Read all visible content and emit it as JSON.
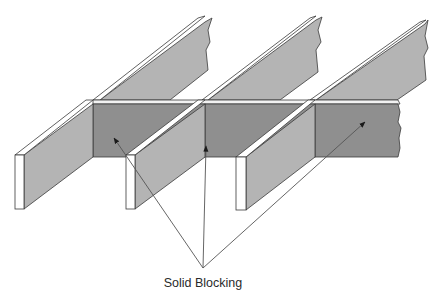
{
  "diagram": {
    "label": "Solid Blocking",
    "colors": {
      "joist_side": "#b4b4b4",
      "joist_top": "#ffffff",
      "blocking_face": "#8f8f8f",
      "blocking_top": "#f2f2f2",
      "outline": "#3a3a3a",
      "leader": "#555555",
      "arrowhead": "#1a1a1a"
    },
    "joists": [
      {
        "name": "joist-1",
        "front_x": 15
      },
      {
        "name": "joist-2",
        "front_x": 126
      },
      {
        "name": "joist-3",
        "front_x": 236
      }
    ],
    "blocks": [
      {
        "name": "block-1",
        "x": [
          93,
          205
        ]
      },
      {
        "name": "block-2",
        "x": [
          205,
          315
        ]
      },
      {
        "name": "block-3",
        "x": [
          315,
          400
        ]
      }
    ],
    "leaders": {
      "origin": [
        203,
        268
      ],
      "targets": [
        [
          114,
          138
        ],
        [
          206,
          146
        ],
        [
          365,
          122
        ]
      ]
    }
  }
}
